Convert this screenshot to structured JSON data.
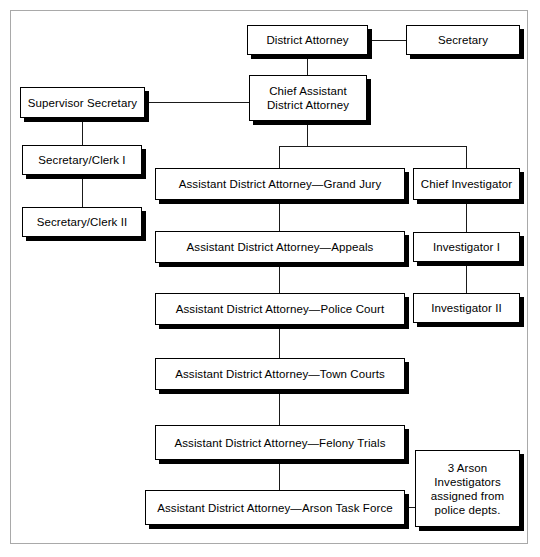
{
  "figure": {
    "kind": "organization-chart",
    "frame_color": "#a9a9a9",
    "box_border_color": "#000000",
    "box_fill_color": "#ffffff",
    "line_color": "#1a1a1a",
    "shadow_color": "#000000"
  },
  "nodes": {
    "district_attorney": "District Attorney",
    "secretary": "Secretary",
    "chief_assistant_district_attorney": "Chief Assistant\nDistrict Attorney",
    "supervisor_secretary": "Supervisor Secretary",
    "secretary_clerk_1": "Secretary/Clerk I",
    "secretary_clerk_2": "Secretary/Clerk II",
    "ada_grand_jury": "Assistant District Attorney—Grand Jury",
    "ada_appeals": "Assistant District Attorney—Appeals",
    "ada_police_court": "Assistant District Attorney—Police Court",
    "ada_town_courts": "Assistant District Attorney—Town Courts",
    "ada_felony_trials": "Assistant District Attorney—Felony Trials",
    "ada_arson_task_force": "Assistant District Attorney—Arson Task Force",
    "chief_investigator": "Chief Investigator",
    "investigator_1": "Investigator I",
    "investigator_2": "Investigator II",
    "arson_note": "3 Arson\nInvestigators\nassigned from\npolice depts."
  }
}
